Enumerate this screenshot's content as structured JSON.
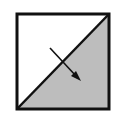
{
  "diagram": {
    "colors": {
      "background": "#ffffff",
      "shaded_region": "#bdbdbd",
      "stroke": "#111111"
    },
    "regions": [
      {
        "name": "upper-left-triangle",
        "fill": "white"
      },
      {
        "name": "lower-right-triangle",
        "fill": "gray"
      }
    ],
    "arrow": {
      "direction": "down-right",
      "from": "white-region",
      "to": "shaded-region"
    }
  }
}
